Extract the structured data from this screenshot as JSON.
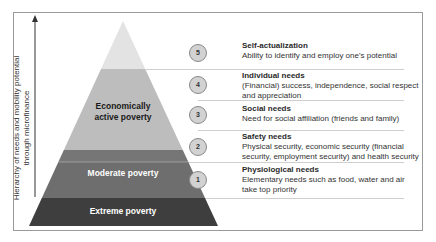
{
  "axis": {
    "label_line1": "Hierarchy of needs and mobility potential",
    "label_line2": "through microfinance"
  },
  "pyramid": {
    "bands": [
      {
        "name": "top",
        "label": "",
        "color": "#e3e3e3"
      },
      {
        "name": "economically-active",
        "label_line1": "Economically",
        "label_line2": "active poverty",
        "color": "#bdbdbd",
        "text_color": "#1a1a1a"
      },
      {
        "name": "dark-strip",
        "label": "",
        "color": "#767676"
      },
      {
        "name": "moderate",
        "label": "Moderate poverty",
        "color": "#6e6e6e",
        "text_color": "#ffffff"
      },
      {
        "name": "extreme",
        "label": "Extreme poverty",
        "color": "#3e3e3e",
        "text_color": "#ffffff"
      }
    ]
  },
  "levels": [
    {
      "number": "5",
      "title": "Self-actualization",
      "desc": "Ability to identify and employ one's potential"
    },
    {
      "number": "4",
      "title": "Individual needs",
      "desc": "(Financial) success, independence, social respect and appreciation"
    },
    {
      "number": "3",
      "title": "Social needs",
      "desc": "Need for social  affiliation (friends and family)"
    },
    {
      "number": "2",
      "title": "Safety needs",
      "desc": "Physical security, economic security (financial security, employment security) and health security"
    },
    {
      "number": "1",
      "title": "Physiological needs",
      "desc": "Elementary needs such as food, water and air take top priority"
    }
  ]
}
